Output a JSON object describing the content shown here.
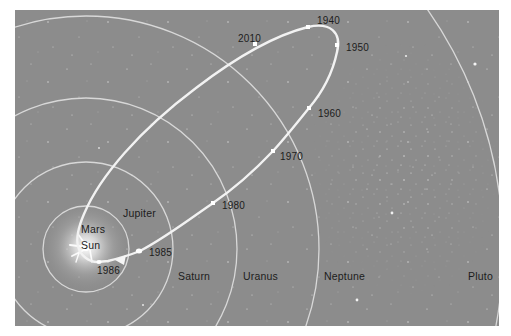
{
  "figure": {
    "colors": {
      "background": "#8c8c8c",
      "orbit_line": "#f2f2f2",
      "planet_orbit": "#d6d6d6",
      "text": "#1c1c1c"
    },
    "center": {
      "label": "Sun"
    },
    "planets": [
      {
        "name": "Mars",
        "label": "Mars",
        "radius": 43
      },
      {
        "name": "Jupiter",
        "label": "Jupiter",
        "radius": 87
      },
      {
        "name": "Saturn",
        "label": "Saturn",
        "radius": 151
      },
      {
        "name": "Uranus",
        "label": "Uranus",
        "radius": 233
      },
      {
        "name": "Neptune",
        "label": "Neptune",
        "radius": 417
      },
      {
        "name": "Pluto",
        "label": "Pluto"
      }
    ],
    "comet_positions": [
      {
        "year": "1940"
      },
      {
        "year": "1950"
      },
      {
        "year": "1960"
      },
      {
        "year": "1970"
      },
      {
        "year": "1980"
      },
      {
        "year": "1985"
      },
      {
        "year": "1986"
      },
      {
        "year": "2010"
      }
    ]
  }
}
